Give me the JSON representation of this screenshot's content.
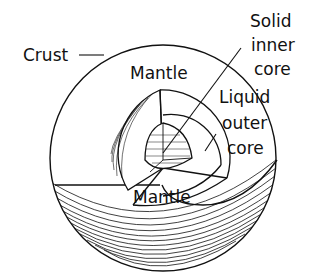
{
  "diagram": {
    "title": "",
    "labels": {
      "crust": "Crust",
      "mantle_top": "Mantle",
      "mantle_bottom": "Mantle",
      "inner_core_1": "Solid",
      "inner_core_2": "inner",
      "inner_core_3": "core",
      "outer_core_1": "Liquid",
      "outer_core_2": "outer",
      "outer_core_3": "core"
    },
    "layers": [
      "Crust",
      "Mantle",
      "Liquid outer core",
      "Solid inner core"
    ],
    "colors": {
      "ink": "#111111",
      "background": "#ffffff"
    }
  }
}
